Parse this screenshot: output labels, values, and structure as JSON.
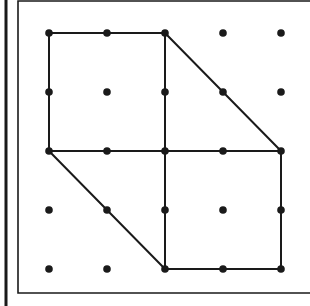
{
  "figure": {
    "grid": {
      "cols": 5,
      "rows": 5,
      "origin_px": [
        49,
        33
      ],
      "spacing_px": [
        58,
        59
      ]
    },
    "colors": {
      "background": "#ffffff",
      "ink": "#1a1a1a"
    },
    "segments": [
      {
        "from": [
          0,
          0
        ],
        "to": [
          2,
          0
        ]
      },
      {
        "from": [
          0,
          0
        ],
        "to": [
          0,
          2
        ]
      },
      {
        "from": [
          2,
          0
        ],
        "to": [
          2,
          4
        ]
      },
      {
        "from": [
          0,
          2
        ],
        "to": [
          4,
          2
        ]
      },
      {
        "from": [
          2,
          0
        ],
        "to": [
          4,
          2
        ]
      },
      {
        "from": [
          0,
          2
        ],
        "to": [
          2,
          4
        ]
      },
      {
        "from": [
          4,
          2
        ],
        "to": [
          4,
          4
        ]
      },
      {
        "from": [
          2,
          4
        ],
        "to": [
          4,
          4
        ]
      }
    ],
    "frame": {
      "outer_left_bar_x": 6,
      "inner_rect": {
        "x": 18,
        "y": 1,
        "bottom": 293
      }
    }
  }
}
